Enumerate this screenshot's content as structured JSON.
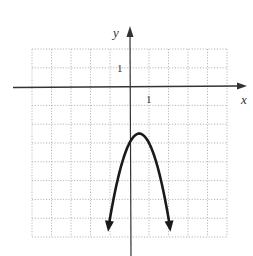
{
  "chart_data": {
    "type": "line",
    "title": "",
    "xlabel": "x",
    "ylabel": "y",
    "xlim": [
      -5,
      5
    ],
    "ylim": [
      -8,
      2
    ],
    "grid": true,
    "grid_style": "dotted",
    "tick_labels": {
      "x": "1",
      "y": "1"
    },
    "legend": null,
    "series": [
      {
        "name": "parabola",
        "equation": "y = -2x^2 + 2x - 3",
        "vertex": [
          0.5,
          -2.5
        ],
        "y_intercept": -3,
        "direction": "opens downward",
        "x": [
          -1.1,
          -1,
          -0.5,
          0,
          0.5,
          1,
          1.5,
          2,
          2.1
        ],
        "values": [
          -7.62,
          -7,
          -4.5,
          -3,
          -2.5,
          -3,
          -4.5,
          -7,
          -7.62
        ],
        "arrows_at_ends": true
      }
    ]
  },
  "axes": {
    "x_label": "x",
    "y_label": "y",
    "x_unit_label": "1",
    "y_unit_label": "1"
  },
  "colors": {
    "curve": "#1a1a1a",
    "axes": "#333333",
    "grid": "#b0b0b0"
  }
}
